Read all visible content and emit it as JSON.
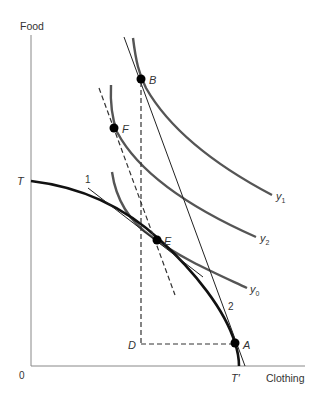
{
  "diagram": {
    "type": "trade-indifference-curve-diagram",
    "axes": {
      "y_label": "Food",
      "x_label": "Clothing",
      "origin_label": "0"
    },
    "ppf": {
      "label_start": "T",
      "label_end": "T′"
    },
    "points": {
      "B": "B",
      "F": "F",
      "E": "E",
      "D": "D",
      "A": "A"
    },
    "indifference_curves": [
      {
        "name": "y1",
        "base": "y",
        "sub": "1"
      },
      {
        "name": "y2",
        "base": "y",
        "sub": "2"
      },
      {
        "name": "y0",
        "base": "y",
        "sub": "0"
      }
    ],
    "price_lines": [
      {
        "label": "1"
      },
      {
        "label": "2"
      }
    ],
    "colors": {
      "axis": "#888888",
      "ppf": "#111111",
      "indifference": "#555555",
      "line": "#222222",
      "point": "#000000"
    }
  }
}
